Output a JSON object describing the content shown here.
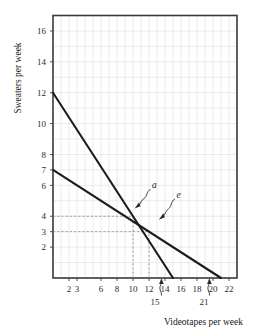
{
  "chart_data": {
    "type": "line",
    "title": "",
    "xlabel": "Videotapes per week",
    "ylabel": "Sweaters per week",
    "xlim": [
      0,
      23
    ],
    "ylim": [
      0,
      17
    ],
    "grid": true,
    "legend": "none",
    "x_ticks": [
      2,
      3,
      6,
      8,
      10,
      12,
      14,
      16,
      18,
      20,
      22
    ],
    "x_tick_labels": [
      "2",
      "3",
      "6",
      "8",
      "10",
      "12",
      "14",
      "16",
      "18",
      "20",
      "22"
    ],
    "y_ticks": [
      2,
      3,
      4,
      6,
      7,
      8,
      10,
      12,
      14,
      16
    ],
    "y_tick_labels": [
      "2",
      "3",
      "4",
      "6",
      "7",
      "8",
      "10",
      "12",
      "14",
      "16"
    ],
    "series": [
      {
        "name": "a",
        "label": "a",
        "points": [
          [
            0,
            12
          ],
          [
            15,
            0
          ]
        ],
        "x_intercept": 15,
        "y_intercept": 12,
        "slope": -0.8
      },
      {
        "name": "e",
        "label": "e",
        "points": [
          [
            0,
            7
          ],
          [
            21,
            0
          ]
        ],
        "x_intercept": 21,
        "y_intercept": 7,
        "slope": -0.3333
      }
    ],
    "annotations": [
      {
        "name": "line-a-label",
        "text": "a",
        "x": 13.2,
        "y": 5.6
      },
      {
        "name": "line-e-label",
        "text": "e",
        "x": 17.0,
        "y": 4.8
      },
      {
        "name": "x-intercept-a",
        "text": "15",
        "x": 15,
        "y": 0
      },
      {
        "name": "x-intercept-e",
        "text": "21",
        "x": 21,
        "y": 0
      }
    ],
    "guide_lines": [
      {
        "name": "guide-y-4",
        "orientation": "horizontal",
        "value": 4,
        "from": 0,
        "to": 10
      },
      {
        "name": "guide-y-3",
        "orientation": "horizontal",
        "value": 3,
        "from": 0,
        "to": 12
      },
      {
        "name": "guide-x-10",
        "orientation": "vertical",
        "value": 10,
        "from": 0,
        "to": 4
      },
      {
        "name": "guide-x-12",
        "orientation": "vertical",
        "value": 12,
        "from": 0,
        "to": 3
      }
    ]
  },
  "axes": {
    "x_title": "Videotapes per week",
    "y_title": "Sweaters per week"
  },
  "labels": {
    "y": [
      "16",
      "14",
      "12",
      "10",
      "8",
      "7",
      "6",
      "4",
      "3",
      "2"
    ],
    "x": [
      "2",
      "3",
      "6",
      "8",
      "10",
      "12",
      "14",
      "16",
      "18",
      "20",
      "22"
    ],
    "line_a": "a",
    "line_e": "e",
    "callout_15": "15",
    "callout_21": "21"
  },
  "colors": {
    "line": "#1c1c1c",
    "grid": "#d8dce4",
    "frame": "#3a3a3a",
    "dash": "#8a8a8a",
    "text": "#1a1a1a",
    "background": "#ffffff"
  }
}
